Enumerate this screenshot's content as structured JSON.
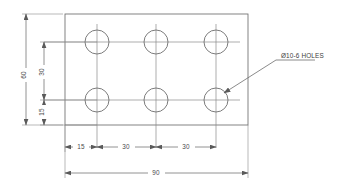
{
  "drawing": {
    "title": "Plate with six holes - orthographic detail",
    "units": "mm",
    "style": {
      "background": "#ffffff",
      "object_line_color": "#6d6d6d",
      "center_line_color": "#8a8a8a",
      "dimension_line_color": "#6d6d6d",
      "text_color": "#4a4a4a"
    },
    "plate": {
      "name": "rectangular-plate",
      "width_value": "90",
      "height_value": "60"
    },
    "holes": {
      "count": 6,
      "diameter_value": "10",
      "arrangement": "3 columns x 2 rows"
    },
    "notes": [
      {
        "id": "hole-callout",
        "text": "Ø10-6 HOLES"
      }
    ],
    "dimensions": {
      "horizontal": [
        {
          "id": "h-15",
          "label": "15"
        },
        {
          "id": "h-30-a",
          "label": "30"
        },
        {
          "id": "h-30-b",
          "label": "30"
        },
        {
          "id": "h-overall-90",
          "label": "90"
        }
      ],
      "vertical": [
        {
          "id": "v-overall-60",
          "label": "60"
        },
        {
          "id": "v-30",
          "label": "30"
        },
        {
          "id": "v-15",
          "label": "15"
        }
      ]
    }
  }
}
